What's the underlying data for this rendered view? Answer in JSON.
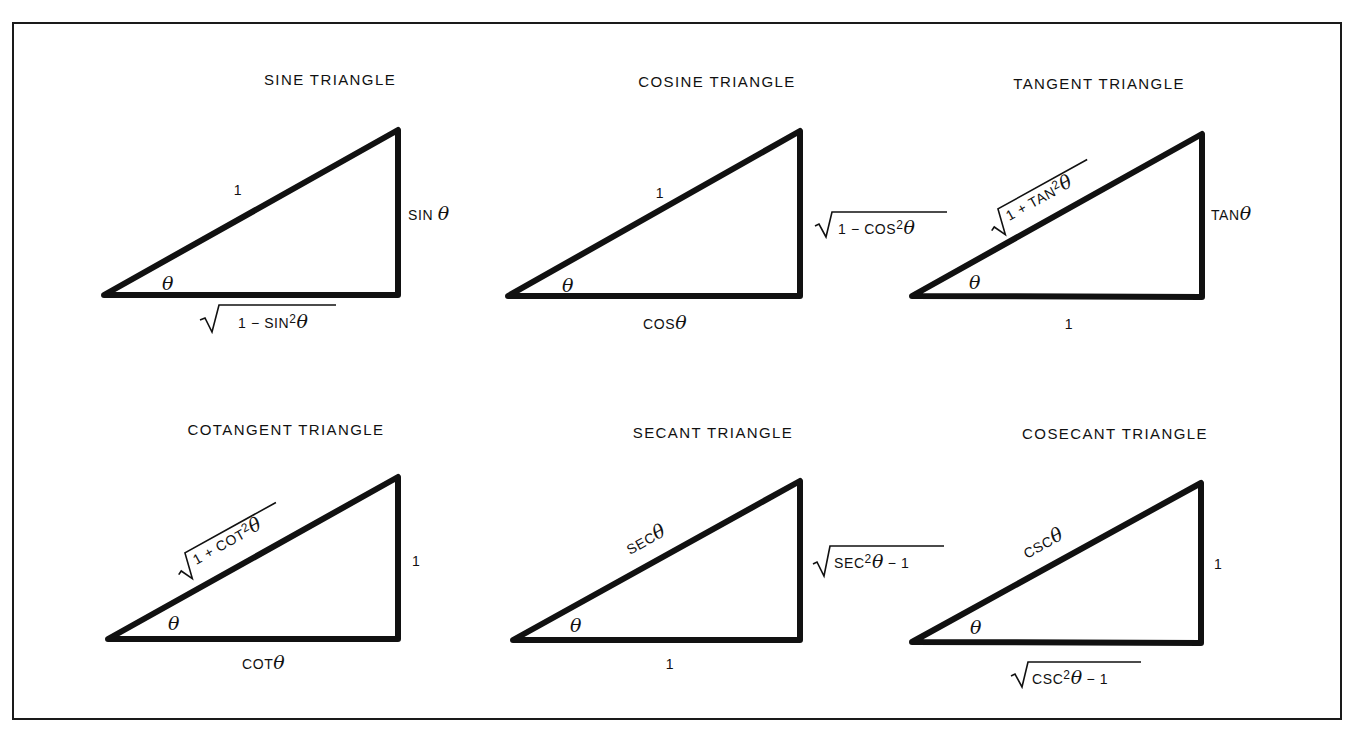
{
  "figure": {
    "panels": [
      {
        "id": "sine",
        "title": "SINE TRIANGLE",
        "hypotenuse": "1",
        "opposite": "SIN θ",
        "adjacent": "√(1 − SIN²θ)",
        "adjacent_parts": {
          "pre": "1 − SIN",
          "sup": "2",
          "post": "θ"
        },
        "angle": "θ"
      },
      {
        "id": "cosine",
        "title": "COSINE TRIANGLE",
        "hypotenuse": "1",
        "opposite": "√(1 − COS²θ)",
        "opposite_parts": {
          "pre": "1 − COS",
          "sup": "2",
          "post": "θ"
        },
        "adjacent": "COSθ",
        "adjacent_parts": {
          "pre": "COS",
          "post": "θ"
        },
        "angle": "θ"
      },
      {
        "id": "tangent",
        "title": "TANGENT TRIANGLE",
        "hypotenuse": "√(1 + TAN²θ)",
        "hypotenuse_parts": {
          "pre": "1 + TAN",
          "sup": "2",
          "post": "θ"
        },
        "opposite": "TANθ",
        "opposite_parts": {
          "pre": "TAN",
          "post": "θ"
        },
        "adjacent": "1",
        "angle": "θ"
      },
      {
        "id": "cotangent",
        "title": "COTANGENT TRIANGLE",
        "hypotenuse": "√(1 + COT²θ)",
        "hypotenuse_parts": {
          "pre": "1 + COT",
          "sup": "2",
          "post": "θ"
        },
        "opposite": "1",
        "adjacent": "COTθ",
        "adjacent_parts": {
          "pre": "COT",
          "post": "θ"
        },
        "angle": "θ"
      },
      {
        "id": "secant",
        "title": "SECANT TRIANGLE",
        "hypotenuse": "SECθ",
        "hypotenuse_parts": {
          "pre": "SEC",
          "post": "θ"
        },
        "opposite": "√(SEC²θ − 1)",
        "opposite_parts": {
          "pre": "SEC",
          "sup": "2",
          "post": "θ",
          "tail": " − 1"
        },
        "adjacent": "1",
        "angle": "θ"
      },
      {
        "id": "cosecant",
        "title": "COSECANT TRIANGLE",
        "hypotenuse": "CSCθ",
        "hypotenuse_parts": {
          "pre": "CSC",
          "post": "θ"
        },
        "opposite": "1",
        "adjacent": "√(CSC²θ − 1)",
        "adjacent_parts": {
          "pre": "CSC",
          "sup": "2",
          "post": "θ",
          "tail": " − 1"
        },
        "angle": "θ"
      }
    ],
    "colors": {
      "ink": "#111111",
      "background": "#ffffff"
    }
  }
}
